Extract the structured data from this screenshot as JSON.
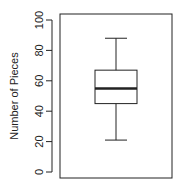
{
  "chart_data": {
    "type": "boxplot",
    "title": "",
    "xlabel": "",
    "ylabel": "Number of Pieces",
    "ylim": [
      0,
      100
    ],
    "yticks": [
      0,
      20,
      40,
      60,
      80,
      100
    ],
    "ytick_labels": [
      "0",
      "20",
      "40",
      "60",
      "80",
      "100"
    ],
    "grid": false,
    "legend": null,
    "series": [
      {
        "name": "",
        "whisker_low": 21,
        "q1": 45,
        "median": 55,
        "q3": 67,
        "whisker_high": 88
      }
    ]
  },
  "colors": {
    "stroke": "#222222",
    "background": "#ffffff"
  }
}
